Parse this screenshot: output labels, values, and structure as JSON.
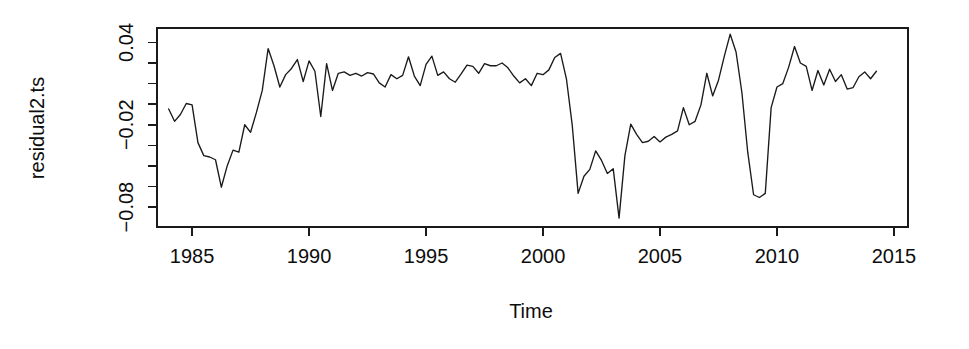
{
  "chart_data": {
    "type": "line",
    "title": "",
    "xlabel": "Time",
    "ylabel": "residual2.ts",
    "xlim": [
      1983.5,
      2015.6
    ],
    "ylim": [
      -0.0945,
      0.0505
    ],
    "grid": false,
    "legend": "none",
    "line_color": "#1a1a1a",
    "x_ticks": [
      1985,
      1990,
      1995,
      2000,
      2005,
      2010,
      2015
    ],
    "x_tick_labels": [
      "1985",
      "1990",
      "1995",
      "2000",
      "2005",
      "2010",
      "2015"
    ],
    "y_ticks": [
      0.04,
      0.01,
      -0.02,
      -0.05,
      -0.08
    ],
    "y_tick_labels": [
      "0.04",
      "",
      "-0.02",
      "",
      "-0.08"
    ],
    "y_minor_ticks": [
      0.04,
      0.01,
      -0.02,
      -0.05,
      -0.08
    ],
    "y_all_tick_values": [
      0.04,
      0.025,
      0.01,
      -0.005,
      -0.02,
      -0.035,
      -0.05,
      -0.065,
      -0.08
    ],
    "series": [
      {
        "name": "residual2.ts",
        "x": [
          1984.0,
          1984.25,
          1984.5,
          1984.75,
          1985.0,
          1985.25,
          1985.5,
          1985.75,
          1986.0,
          1986.25,
          1986.5,
          1986.75,
          1987.0,
          1987.25,
          1987.5,
          1987.75,
          1988.0,
          1988.25,
          1988.5,
          1988.75,
          1989.0,
          1989.25,
          1989.5,
          1989.75,
          1990.0,
          1990.25,
          1990.5,
          1990.75,
          1991.0,
          1991.25,
          1991.5,
          1991.75,
          1992.0,
          1992.25,
          1992.5,
          1992.75,
          1993.0,
          1993.25,
          1993.5,
          1993.75,
          1994.0,
          1994.25,
          1994.5,
          1994.75,
          1995.0,
          1995.25,
          1995.5,
          1995.75,
          1996.0,
          1996.25,
          1996.5,
          1996.75,
          1997.0,
          1997.25,
          1997.5,
          1997.75,
          1998.0,
          1998.25,
          1998.5,
          1998.75,
          1999.0,
          1999.25,
          1999.5,
          1999.75,
          2000.0,
          2000.25,
          2000.5,
          2000.75,
          2001.0,
          2001.25,
          2001.5,
          2001.75,
          2002.0,
          2002.25,
          2002.5,
          2002.75,
          2003.0,
          2003.25,
          2003.5,
          2003.75,
          2004.0,
          2004.25,
          2004.5,
          2004.75,
          2005.0,
          2005.25,
          2005.5,
          2005.75,
          2006.0,
          2006.25,
          2006.5,
          2006.75,
          2007.0,
          2007.25,
          2007.5,
          2007.75,
          2008.0,
          2008.25,
          2008.5,
          2008.75,
          2009.0,
          2009.25,
          2009.5,
          2009.75,
          2010.0,
          2010.25,
          2010.5,
          2010.75,
          2011.0,
          2011.25,
          2011.5,
          2011.75,
          2012.0,
          2012.25,
          2012.5,
          2012.75,
          2013.0,
          2013.25,
          2013.5,
          2013.75,
          2014.0,
          2014.25
        ],
        "y": [
          -0.0085,
          -0.0175,
          -0.0125,
          -0.0045,
          -0.0055,
          -0.033,
          -0.0425,
          -0.0435,
          -0.0455,
          -0.0655,
          -0.05,
          -0.0385,
          -0.04,
          -0.02,
          -0.0255,
          -0.011,
          0.005,
          0.0355,
          0.023,
          0.0075,
          0.0165,
          0.021,
          0.0275,
          0.0115,
          0.0265,
          0.019,
          -0.014,
          0.0245,
          0.005,
          0.0175,
          0.0185,
          0.016,
          0.0175,
          0.0155,
          0.018,
          0.017,
          0.0105,
          0.0075,
          0.0165,
          0.0135,
          0.016,
          0.0295,
          0.0155,
          0.0085,
          0.024,
          0.03,
          0.016,
          0.0185,
          0.0135,
          0.011,
          0.017,
          0.0235,
          0.0225,
          0.0175,
          0.0245,
          0.023,
          0.023,
          0.025,
          0.0215,
          0.0155,
          0.0105,
          0.0135,
          0.0085,
          0.0175,
          0.0165,
          0.02,
          0.029,
          0.032,
          0.0135,
          -0.0205,
          -0.07,
          -0.0575,
          -0.0525,
          -0.039,
          -0.046,
          -0.0555,
          -0.052,
          -0.088,
          -0.0425,
          -0.0195,
          -0.027,
          -0.033,
          -0.032,
          -0.0285,
          -0.0325,
          -0.029,
          -0.027,
          -0.0245,
          -0.0075,
          -0.02,
          -0.0175,
          -0.0055,
          0.0175,
          0.001,
          0.0125,
          0.03,
          0.046,
          0.033,
          0.0035,
          -0.04,
          -0.071,
          -0.073,
          -0.07,
          -0.0075,
          0.0075,
          0.01,
          0.022,
          0.037,
          0.025,
          0.0225,
          0.005,
          0.0195,
          0.009,
          0.0205,
          0.0115,
          0.0165,
          0.006,
          0.007,
          0.015,
          0.0185,
          0.0135,
          0.019
        ]
      }
    ]
  },
  "plot_geometry": {
    "left": 157,
    "right": 908,
    "top": 28,
    "bottom": 227
  },
  "labels": {
    "y_axis_title": "residual2.ts",
    "x_axis_title": "Time"
  }
}
